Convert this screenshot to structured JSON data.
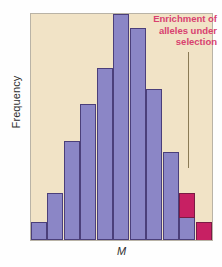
{
  "figure": {
    "background_color": "#fefefe",
    "plot_background_color": "#f1e3c6",
    "frame_color": "#b9b3a6"
  },
  "annotation": {
    "line1": "Enrichment of",
    "line2": "alleles  under",
    "line3": "selection",
    "color": "#d8416f",
    "leader_line_color": "#8a7a55"
  },
  "colors": {
    "bar_fill": "#8b86c6",
    "bar_edge": "#4b3f7a",
    "highlight_fill": "#c72063",
    "highlight_edge": "#7a1b44"
  },
  "chart_data": {
    "type": "bar",
    "title": "",
    "subtitle": "",
    "xlabel": "M",
    "ylabel": "Frequency",
    "grid": false,
    "legend": null,
    "axis_tick_labels": {
      "x": [],
      "y": []
    },
    "ylim": [
      0,
      100
    ],
    "categories": [
      "1",
      "2",
      "3",
      "4",
      "5",
      "6",
      "7",
      "8",
      "9",
      "10",
      "11"
    ],
    "series": [
      {
        "name": "Neutral alleles",
        "color": "#8b86c6",
        "values": [
          8,
          21,
          44,
          60,
          76,
          100,
          94,
          67,
          39,
          21,
          8
        ]
      },
      {
        "name": "Enrichment of alleles under selection",
        "color": "#c72063",
        "values": [
          0,
          0,
          0,
          0,
          0,
          0,
          0,
          0,
          0,
          11,
          12
        ]
      }
    ],
    "stacked": true,
    "annotations": [
      {
        "text": "Enrichment of alleles under selection",
        "points_to_category": "10",
        "color": "#d8416f"
      }
    ]
  }
}
